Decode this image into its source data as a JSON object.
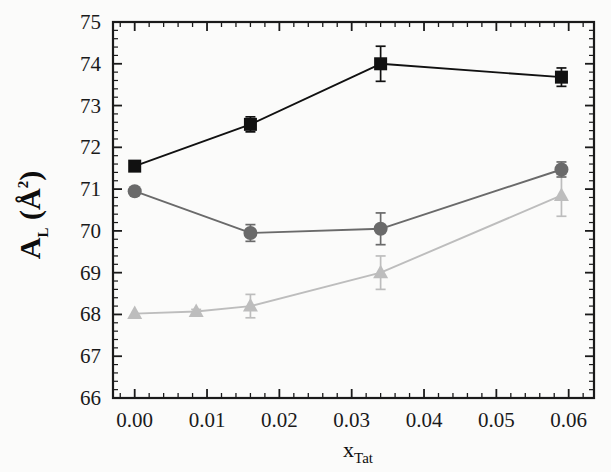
{
  "chart_data": {
    "type": "line",
    "title": "",
    "xlabel": "x_Tat",
    "xlabel_base": "x",
    "xlabel_sub": "Tat",
    "ylabel": "A_L (Å²)",
    "ylabel_base": "A",
    "ylabel_sub": "L",
    "ylabel_unit": "(Å",
    "ylabel_unit_sup": "2",
    "ylabel_unit_close": ")",
    "xlim": [
      -0.003,
      0.0635
    ],
    "ylim": [
      66,
      75
    ],
    "xticks": [
      0.0,
      0.01,
      0.02,
      0.03,
      0.04,
      0.05,
      0.06
    ],
    "xticklabels": [
      "0.00",
      "0.01",
      "0.02",
      "0.03",
      "0.04",
      "0.05",
      "0.06"
    ],
    "yticks": [
      66,
      67,
      68,
      69,
      70,
      71,
      72,
      73,
      74,
      75
    ],
    "yticklabels": [
      "66",
      "67",
      "68",
      "69",
      "70",
      "71",
      "72",
      "73",
      "74",
      "75"
    ],
    "grid": false,
    "legend_position": "none",
    "minor_ticks": true,
    "x": [
      0.0,
      0.0085,
      0.016,
      0.034,
      0.059
    ],
    "series": [
      {
        "name": "series-squares",
        "marker": "square",
        "color": "#111111",
        "x": [
          0.0,
          0.016,
          0.034,
          0.059
        ],
        "values": [
          71.55,
          72.55,
          74.0,
          73.68
        ],
        "errors": [
          0.0,
          0.18,
          0.42,
          0.22
        ]
      },
      {
        "name": "series-circles",
        "marker": "circle",
        "color": "#6a6a6a",
        "x": [
          0.0,
          0.016,
          0.034,
          0.059
        ],
        "values": [
          70.95,
          69.95,
          70.05,
          71.47
        ],
        "errors": [
          0.0,
          0.2,
          0.38,
          0.18
        ]
      },
      {
        "name": "series-triangles",
        "marker": "triangle",
        "color": "#bdbdbd",
        "x": [
          0.0,
          0.0085,
          0.016,
          0.034,
          0.059
        ],
        "values": [
          68.02,
          68.07,
          68.2,
          69.0,
          70.85
        ],
        "errors": [
          0.0,
          0.05,
          0.28,
          0.4,
          0.5
        ]
      }
    ]
  }
}
